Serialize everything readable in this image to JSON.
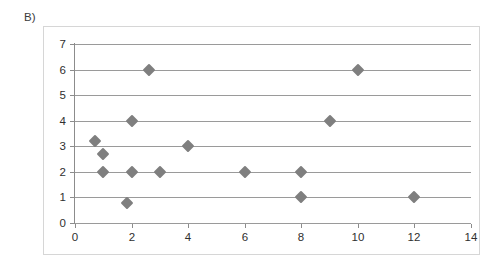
{
  "panel": {
    "label": "B)"
  },
  "colors": {
    "marker": "#7f7f7f",
    "gridline": "#9a9a9a",
    "axis": "#8c8c8c",
    "frame": "#d6d6d6",
    "text": "#2f2f2f",
    "background": "#ffffff"
  },
  "chart_data": {
    "type": "scatter",
    "title": "",
    "subtitle": "",
    "xlabel": "",
    "ylabel": "",
    "xlim": [
      0,
      14
    ],
    "ylim": [
      0,
      7
    ],
    "xticks": [
      0,
      2,
      4,
      6,
      8,
      10,
      12,
      14
    ],
    "yticks": [
      0,
      1,
      2,
      3,
      4,
      5,
      6,
      7
    ],
    "xtick_labels": [
      "0",
      "2",
      "4",
      "6",
      "8",
      "10",
      "12",
      "14"
    ],
    "ytick_labels": [
      "0",
      "1",
      "2",
      "3",
      "4",
      "5",
      "6",
      "7"
    ],
    "grid": "horizontal",
    "legend": "none",
    "marker_shape": "diamond",
    "series": [
      {
        "name": "series-1",
        "points": [
          {
            "x": 0.7,
            "y": 3.2
          },
          {
            "x": 1.0,
            "y": 2.7
          },
          {
            "x": 1.0,
            "y": 2.0
          },
          {
            "x": 1.85,
            "y": 0.8
          },
          {
            "x": 2.0,
            "y": 4.0
          },
          {
            "x": 2.0,
            "y": 2.0
          },
          {
            "x": 2.6,
            "y": 6.0
          },
          {
            "x": 3.0,
            "y": 2.0
          },
          {
            "x": 4.0,
            "y": 3.0
          },
          {
            "x": 6.0,
            "y": 2.0
          },
          {
            "x": 8.0,
            "y": 2.0
          },
          {
            "x": 8.0,
            "y": 1.0
          },
          {
            "x": 9.0,
            "y": 4.0
          },
          {
            "x": 10.0,
            "y": 6.0
          },
          {
            "x": 12.0,
            "y": 1.0
          }
        ]
      }
    ]
  }
}
